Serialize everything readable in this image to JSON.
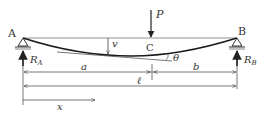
{
  "diagram": {
    "type": "simply-supported-beam-point-load",
    "colors": {
      "line": "#444444",
      "beam": "#1a1a1a",
      "text": "#333333"
    },
    "labels": {
      "support_a": "A",
      "support_b": "B",
      "load": "P",
      "load_point": "C",
      "deflection": "v",
      "slope": "θ",
      "reaction_a_main": "R",
      "reaction_a_sub": "A",
      "reaction_b_main": "R",
      "reaction_b_sub": "B",
      "dim_a": "a",
      "dim_b": "b",
      "span": "ℓ",
      "position": "x"
    }
  }
}
